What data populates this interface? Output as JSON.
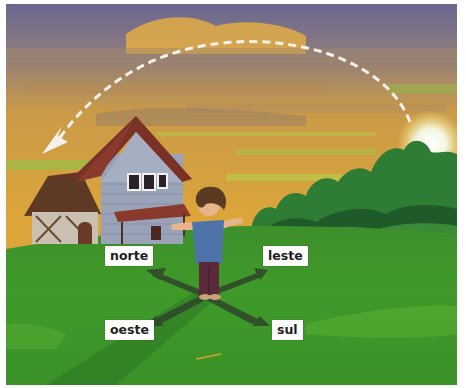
{
  "illustration": {
    "description": "Boy standing on grass with cardinal directions; dashed arrow shows sun path from east (sunrise, right) to west (left)",
    "labels": {
      "north": "norte",
      "east": "leste",
      "west": "oeste",
      "south": "sul"
    },
    "icons": {
      "sun_path_arrow": "dashed-arc-arrow",
      "direction_cross": "four-way-arrow"
    },
    "colors": {
      "sky_top": "#6e6a8e",
      "sky_mid": "#d9a23a",
      "grass": "#3f9a2a",
      "grass_light": "#5cb236",
      "house_wall": "#9aa3b8",
      "roof": "#7a3126",
      "trees": "#2e7a34",
      "label_bg": "#ffffff",
      "label_text": "#1e1e1e"
    }
  }
}
